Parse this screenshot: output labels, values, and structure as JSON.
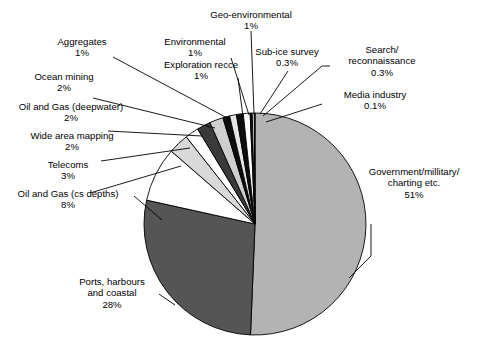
{
  "chart_data": {
    "type": "pie",
    "title": "",
    "subtitle": "",
    "legend_position": "callout-labels",
    "start_angle_deg": 0,
    "direction": "clockwise",
    "categories": [
      "Government/millitary/ charting etc.",
      "Ports, harbours and coastal",
      "Oil and Gas (cs depths)",
      "Telecoms",
      "Wide area mapping",
      "Oil and Gas (deepwater)",
      "Ocean mining",
      "Aggregates",
      "Exploration recce",
      "Environmental",
      "Geo-environmental",
      "Sub-ice survey",
      "Search/ reconnaissance",
      "Media industry"
    ],
    "values": [
      51,
      28,
      8,
      3,
      2,
      2,
      2,
      1,
      1,
      1,
      1,
      0.3,
      0.3,
      0.1
    ],
    "value_labels": [
      "51%",
      "28%",
      "8%",
      "3%",
      "2%",
      "2%",
      "2%",
      "1%",
      "1%",
      "1%",
      "1%",
      "0.3%",
      "0.3%",
      "0.1%"
    ],
    "unit": "%",
    "slice_colors": [
      "#b3b3b3",
      "#555555",
      "#ffffff",
      "#d9d9d9",
      "#ffffff",
      "#3a3a3a",
      "#cfcfcf",
      "#0d0d0d",
      "#e6e6e6",
      "#0d0d0d",
      "#ffffff",
      "#0d0d0d",
      "#ffffff",
      "#0d0d0d"
    ],
    "outline_color": "#000000",
    "grid": false
  },
  "slices": [
    {
      "label": "Government/millitary/",
      "label2": "charting etc.",
      "pct": "51%"
    },
    {
      "label": "Ports, harbours",
      "label2": "and coastal",
      "pct": "28%"
    },
    {
      "label": "Oil and Gas (cs depths)",
      "label2": "",
      "pct": "8%"
    },
    {
      "label": "Telecoms",
      "label2": "",
      "pct": "3%"
    },
    {
      "label": "Wide area mapping",
      "label2": "",
      "pct": "2%"
    },
    {
      "label": "Oil and Gas (deepwater)",
      "label2": "",
      "pct": "2%"
    },
    {
      "label": "Ocean mining",
      "label2": "",
      "pct": "2%"
    },
    {
      "label": "Aggregates",
      "label2": "",
      "pct": "1%"
    },
    {
      "label": "Exploration recce",
      "label2": "",
      "pct": "1%"
    },
    {
      "label": "Environmental",
      "label2": "",
      "pct": "1%"
    },
    {
      "label": "Geo-environmental",
      "label2": "",
      "pct": "1%"
    },
    {
      "label": "Sub-ice survey",
      "label2": "",
      "pct": "0.3%"
    },
    {
      "label": "Search/",
      "label2": "reconnaissance",
      "pct": "0.3%"
    },
    {
      "label": "Media industry",
      "label2": "",
      "pct": "0.1%"
    }
  ]
}
